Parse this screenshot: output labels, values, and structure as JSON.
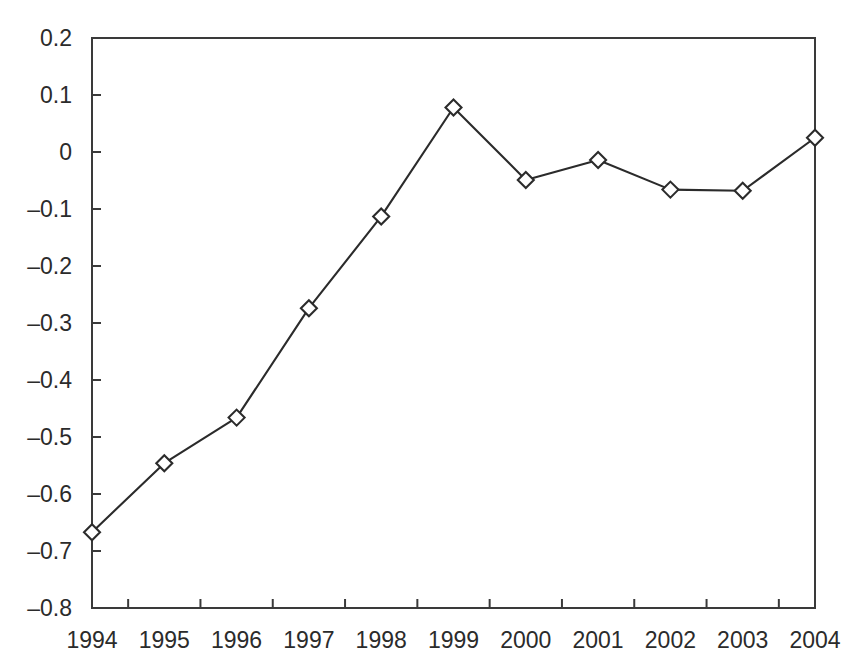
{
  "chart": {
    "type": "line",
    "background_color": "#ffffff",
    "line_color": "#2b2b2b",
    "marker_fill": "#ffffff",
    "marker_shape": "diamond"
  },
  "chart_data": {
    "type": "line",
    "title": "",
    "subtitle": "",
    "xlabel": "",
    "ylabel": "",
    "categories": [
      "1994",
      "1995",
      "1996",
      "1997",
      "1998",
      "1999",
      "2000",
      "2001",
      "2002",
      "2003",
      "2004"
    ],
    "values": [
      -0.667,
      -0.546,
      -0.466,
      -0.274,
      -0.113,
      0.078,
      -0.049,
      -0.014,
      -0.066,
      -0.068,
      0.025
    ],
    "series": [
      {
        "name": "series-1",
        "values": [
          -0.667,
          -0.546,
          -0.466,
          -0.274,
          -0.113,
          0.078,
          -0.049,
          -0.014,
          -0.066,
          -0.068,
          0.025
        ]
      }
    ],
    "ylim": [
      -0.8,
      0.2
    ],
    "xlim": [
      "1994",
      "2004"
    ],
    "ytick_labels": [
      "0.2",
      "0.1",
      "0",
      "–0.1",
      "–0.2",
      "–0.3",
      "–0.4",
      "–0.5",
      "–0.6",
      "–0.7",
      "–0.8"
    ],
    "ytick_values": [
      0.2,
      0.1,
      0,
      -0.1,
      -0.2,
      -0.3,
      -0.4,
      -0.5,
      -0.6,
      -0.7,
      -0.8
    ],
    "xtick_labels": [
      "1994",
      "1995",
      "1996",
      "1997",
      "1998",
      "1999",
      "2000",
      "2001",
      "2002",
      "2003",
      "2004"
    ],
    "grid": false,
    "legend": false,
    "legend_position": "none",
    "annotations": []
  }
}
